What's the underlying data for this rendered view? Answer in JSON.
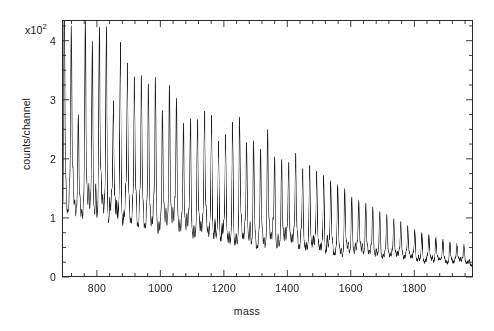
{
  "chart_data": {
    "type": "line",
    "title": "",
    "subtitle": "",
    "xlabel": "mass",
    "ylabel": "counts/channel",
    "y_multiplier_label": "x10",
    "y_multiplier_exponent": "2",
    "y_multiplier_value": 100,
    "xlim": [
      690,
      1985
    ],
    "ylim": [
      0,
      4.35
    ],
    "xticks_major": [
      800,
      1000,
      1200,
      1400,
      1600,
      1800
    ],
    "xtick_labels": [
      "800",
      "1000",
      "1200",
      "1400",
      "1600",
      "1800"
    ],
    "x_minor_tick_interval": 40,
    "yticks_major": [
      0,
      1,
      2,
      3,
      4
    ],
    "ytick_labels": [
      "0",
      "1",
      "2",
      "3",
      "4"
    ],
    "y_minor_tick_interval": 0.25,
    "grid": false,
    "legend": null,
    "frame": "box",
    "tick_direction": "in",
    "line_color": "#1a1a1a",
    "line_width": 0.65,
    "background": "#ffffff",
    "series_name": "mass spectrum",
    "peak_spacing_mass": 22.2,
    "peak_series_start_mass": 694,
    "n_major_peaks": 58,
    "major_peak_heights": [
      4.02,
      3.55,
      2.08,
      3.72,
      3.38,
      3.66,
      3.66,
      2.42,
      3.45,
      3.1,
      2.88,
      2.92,
      2.82,
      2.92,
      2.4,
      2.84,
      2.62,
      2.22,
      2.3,
      2.3,
      2.45,
      2.38,
      1.95,
      2.08,
      2.3,
      2.38,
      1.96,
      2.0,
      1.86,
      2.2,
      1.74,
      1.72,
      1.66,
      1.82,
      1.58,
      1.64,
      1.52,
      1.46,
      1.38,
      1.32,
      1.26,
      1.12,
      1.06,
      1.02,
      0.96,
      0.88,
      0.82,
      0.76,
      0.7,
      0.64,
      0.58,
      0.54,
      0.5,
      0.46,
      0.42,
      0.38,
      0.35,
      0.33
    ],
    "baseline_start": 0.72,
    "baseline_end": 0.16
  },
  "axis": {
    "x_title": "mass",
    "y_title": "counts/channel"
  }
}
